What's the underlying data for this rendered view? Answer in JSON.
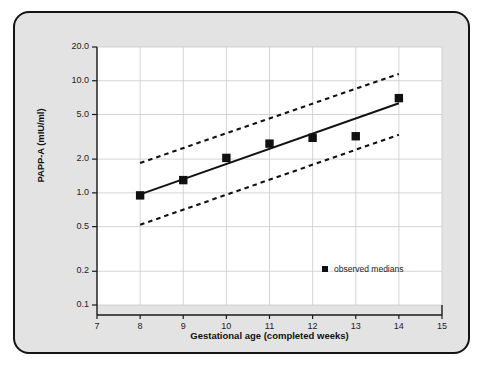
{
  "figure": {
    "panel_bg": "#e3e3e3",
    "plot_bg": "#ffffff",
    "border_color": "#141414",
    "ink_color": "#111111"
  },
  "chart_data": {
    "type": "scatter",
    "title": "",
    "xlabel": "Gestational age (completed weeks)",
    "ylabel": "PAPP-A (mIU/ml)",
    "xlim": [
      7,
      15
    ],
    "ylim": [
      0.1,
      20.0
    ],
    "yscale": "log",
    "grid": true,
    "xticks": [
      7,
      8,
      9,
      10,
      11,
      12,
      13,
      14,
      15
    ],
    "xtick_labels": [
      "7",
      "8",
      "9",
      "10",
      "11",
      "12",
      "13",
      "14",
      "15"
    ],
    "yticks": [
      20.0,
      10.0,
      5.0,
      2.0,
      1.0,
      0.5,
      0.2,
      0.1
    ],
    "ytick_labels": [
      "20.0",
      "10.0",
      "5.0",
      "2.0",
      "1.0",
      "0.5",
      "0.2",
      "0.1"
    ],
    "legend_position": "lower right",
    "series": [
      {
        "name": "observed medians",
        "type": "scatter",
        "marker": "square",
        "color": "#111111",
        "x": [
          8,
          9,
          10,
          11,
          12,
          13,
          14
        ],
        "values": [
          0.95,
          1.3,
          2.05,
          2.75,
          3.1,
          3.2,
          7.0
        ]
      },
      {
        "name": "fitted median regression",
        "type": "line",
        "style": "solid",
        "color": "#111111",
        "x": [
          8,
          14
        ],
        "values": [
          0.97,
          6.3
        ]
      },
      {
        "name": "upper reference limit",
        "type": "line",
        "style": "dashed",
        "color": "#111111",
        "x": [
          8,
          14
        ],
        "values": [
          1.85,
          11.5
        ]
      },
      {
        "name": "lower reference limit",
        "type": "line",
        "style": "dashed",
        "color": "#111111",
        "x": [
          8,
          14
        ],
        "values": [
          0.52,
          3.3
        ]
      }
    ],
    "legend": [
      {
        "label": "observed medians",
        "marker": "square",
        "color": "#111111"
      }
    ]
  }
}
